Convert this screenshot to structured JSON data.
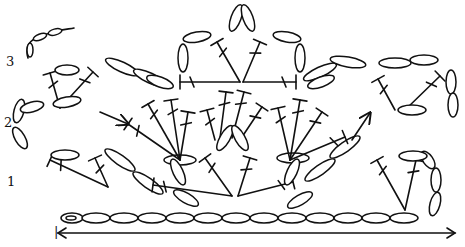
{
  "diagram": {
    "type": "crochet-chart",
    "row_labels": [
      "1",
      "2",
      "3"
    ],
    "start_marker": "|",
    "base_chain_direction": "left-to-right",
    "colors": {
      "ink": "#111111",
      "background": "#ffffff"
    }
  }
}
